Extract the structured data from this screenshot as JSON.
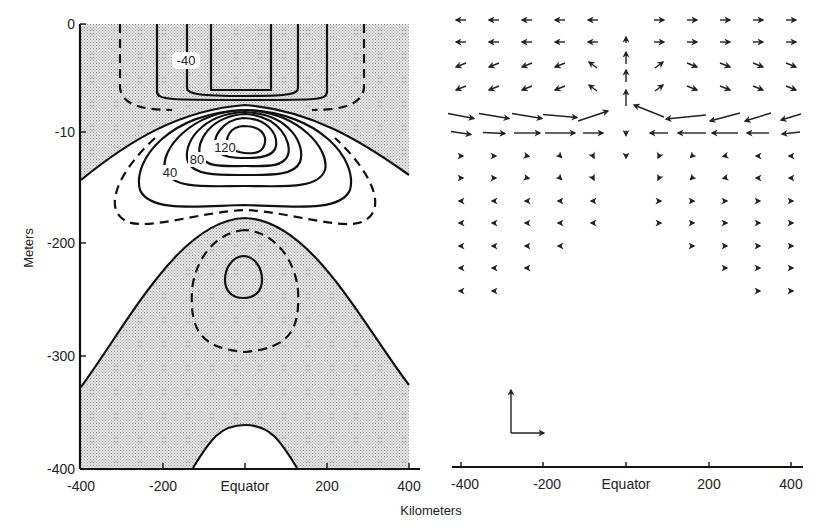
{
  "chart_data": [
    {
      "type": "heatmap",
      "subtype": "contour",
      "panel": "left",
      "title": "",
      "xlabel": "Kilometers",
      "ylabel": "Meters",
      "xlim": [
        -400,
        400
      ],
      "ylim": [
        -400,
        0
      ],
      "x_ticks": [
        "-400",
        "-200",
        "Equator",
        "200",
        "400"
      ],
      "y_ticks": [
        "0",
        "-10",
        "-200",
        "-300",
        "-400"
      ],
      "contour_labels": [
        "-40",
        "120",
        "80",
        "40"
      ],
      "contour_interval": 20,
      "shading": "stippled regions mark negative (westward) values",
      "line_styles": {
        "solid": "nonzero contours",
        "dashed": "intermediate contours"
      },
      "features": [
        {
          "name": "surface westward flow",
          "min_label": "-40",
          "location": "0 to -8 m near Equator"
        },
        {
          "name": "equatorial undercurrent core",
          "max_label": "120",
          "location": "about -10 m at Equator"
        },
        {
          "name": "deep westward cell",
          "location": "about -230 m at Equator"
        }
      ]
    },
    {
      "type": "scatter",
      "subtype": "vector_field",
      "panel": "right",
      "xlabel": "Kilometers",
      "xlim": [
        -400,
        400
      ],
      "x_ticks": [
        "-400",
        "-200",
        "Equator",
        "200",
        "400"
      ],
      "legend": "reference arrows (vertical and horizontal scale)",
      "pattern": "surface divergence from Equator, convergent flow toward Equator at -10 m with upwelling at Equator, weak meridional flow at depth"
    }
  ],
  "left_panel": {
    "y_axis_title": "Meters",
    "y_ticks": [
      {
        "label": "0",
        "y": 24
      },
      {
        "label": "-10",
        "y": 132
      },
      {
        "label": "-200",
        "y": 243
      },
      {
        "label": "-300",
        "y": 356
      },
      {
        "label": "-400",
        "y": 468
      }
    ],
    "x_ticks": [
      {
        "label": "-400",
        "x": 81
      },
      {
        "label": "-200",
        "x": 163
      },
      {
        "label": "Equator",
        "x": 245
      },
      {
        "label": "200",
        "x": 327
      },
      {
        "label": "400",
        "x": 409
      }
    ],
    "contour_labels": [
      {
        "text": "-40",
        "x": 186,
        "y": 64
      },
      {
        "text": "120",
        "x": 224,
        "y": 151
      },
      {
        "text": "80",
        "x": 196,
        "y": 163
      },
      {
        "text": "40",
        "x": 170,
        "y": 176
      }
    ]
  },
  "right_panel": {
    "x_ticks": [
      {
        "label": "-400",
        "x": 461
      },
      {
        "label": "-200",
        "x": 543
      },
      {
        "label": "Equator",
        "x": 626
      },
      {
        "label": "200",
        "x": 709
      },
      {
        "label": "400",
        "x": 791
      }
    ]
  },
  "x_axis_title": "Kilometers",
  "colors": {
    "ink": "#111111",
    "stipple": "#d6d6d6",
    "background": "#ffffff"
  }
}
